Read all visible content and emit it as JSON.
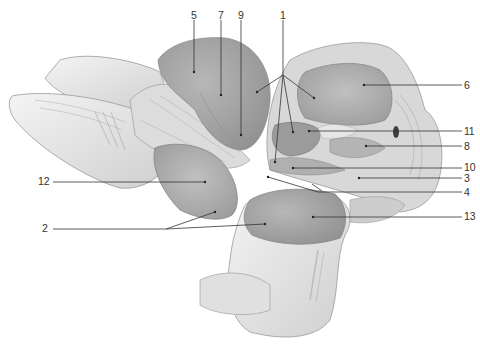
{
  "figure": {
    "type": "anatomical-illustration",
    "style": "grayscale pencil illustration",
    "colors": {
      "background": "#ffffff",
      "bone_light": "#ececec",
      "bone_mid": "#d4d4d4",
      "cartilage_surface": "#a9a9a9",
      "cartilage_dark": "#8f8f8f",
      "leader_line": "#333333",
      "label_text": "#333333"
    }
  },
  "labels": [
    {
      "id": "5",
      "text": "5",
      "x": 191,
      "y": 10,
      "anchor_x": 194,
      "anchor_y": 72,
      "line": [
        [
          194,
          20
        ],
        [
          194,
          72
        ]
      ]
    },
    {
      "id": "7",
      "text": "7",
      "x": 218,
      "y": 10,
      "anchor_x": 221,
      "anchor_y": 95,
      "line": [
        [
          221,
          20
        ],
        [
          221,
          95
        ]
      ]
    },
    {
      "id": "9",
      "text": "9",
      "x": 238,
      "y": 10,
      "anchor_x": 241,
      "anchor_y": 135,
      "line": [
        [
          241,
          20
        ],
        [
          241,
          135
        ]
      ]
    },
    {
      "id": "1",
      "text": "1",
      "x": 280,
      "y": 10,
      "anchor_x": 283,
      "anchor_y": 75,
      "line": [
        [
          283,
          20
        ],
        [
          283,
          75
        ]
      ],
      "branches": [
        [
          [
            283,
            75
          ],
          [
            257,
            92
          ]
        ],
        [
          [
            283,
            75
          ],
          [
            314,
            98
          ]
        ],
        [
          [
            283,
            75
          ],
          [
            293,
            132
          ]
        ],
        [
          [
            283,
            75
          ],
          [
            275,
            162
          ]
        ]
      ]
    },
    {
      "id": "6",
      "text": "6",
      "x": 464,
      "y": 80,
      "line": [
        [
          364,
          85
        ],
        [
          462,
          85
        ]
      ]
    },
    {
      "id": "11",
      "text": "11",
      "x": 464,
      "y": 126,
      "line": [
        [
          309,
          131
        ],
        [
          462,
          131
        ]
      ]
    },
    {
      "id": "8",
      "text": "8",
      "x": 464,
      "y": 141,
      "line": [
        [
          366,
          146
        ],
        [
          462,
          146
        ]
      ]
    },
    {
      "id": "10",
      "text": "10",
      "x": 464,
      "y": 162,
      "line": [
        [
          293,
          168
        ],
        [
          462,
          168
        ]
      ]
    },
    {
      "id": "3",
      "text": "3",
      "x": 464,
      "y": 173,
      "line": [
        [
          359,
          178
        ],
        [
          462,
          178
        ]
      ]
    },
    {
      "id": "4",
      "text": "4",
      "x": 464,
      "y": 187,
      "line": [
        [
          268,
          177
        ],
        [
          318,
          192
        ],
        [
          462,
          192
        ]
      ],
      "branch": [
        [
          312,
          184
        ],
        [
          322,
          191
        ]
      ]
    },
    {
      "id": "13",
      "text": "13",
      "x": 464,
      "y": 211,
      "line": [
        [
          313,
          217
        ],
        [
          462,
          217
        ]
      ]
    },
    {
      "id": "12",
      "text": "12",
      "x": 38,
      "y": 176,
      "line": [
        [
          53,
          182
        ],
        [
          205,
          182
        ]
      ]
    },
    {
      "id": "2",
      "text": "2",
      "x": 42,
      "y": 223,
      "line": [
        [
          53,
          229
        ],
        [
          166,
          229
        ]
      ],
      "branches": [
        [
          [
            166,
            229
          ],
          [
            215,
            212
          ]
        ],
        [
          [
            166,
            229
          ],
          [
            265,
            224
          ]
        ]
      ]
    }
  ]
}
